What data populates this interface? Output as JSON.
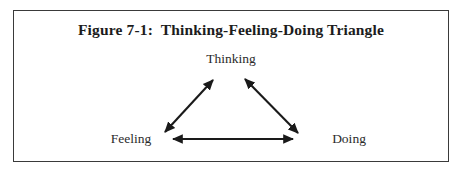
{
  "figure": {
    "caption": "Figure 7-1:  Thinking-Feeling-Doing Triangle",
    "frame": {
      "border_color": "#3a3a3a",
      "background": "#ffffff"
    }
  },
  "diagram": {
    "type": "triangle",
    "line_color": "#1a1a1a",
    "nodes": [
      {
        "id": "thinking",
        "label": "Thinking",
        "position": "apex"
      },
      {
        "id": "feeling",
        "label": "Feeling",
        "position": "bottom-left"
      },
      {
        "id": "doing",
        "label": "Doing",
        "position": "bottom-right"
      }
    ],
    "connections": [
      {
        "from": "feeling",
        "to": "thinking",
        "arrows": "double"
      },
      {
        "from": "thinking",
        "to": "doing",
        "arrows": "double"
      },
      {
        "from": "feeling",
        "to": "doing",
        "arrows": "double"
      }
    ]
  }
}
